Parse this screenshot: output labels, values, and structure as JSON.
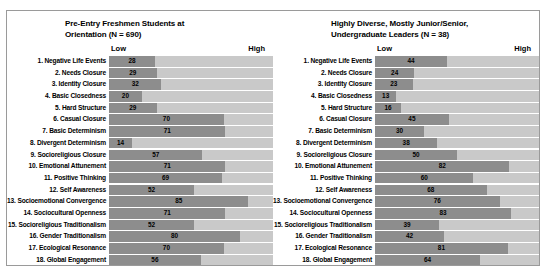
{
  "figure": {
    "background": "#ffffff",
    "bar_color": "#8d8d8d",
    "track_color": "#c9c9c9",
    "border_color": "#9a9a9a"
  },
  "axis": {
    "low_label": "Low",
    "high_label": "High",
    "min": 0,
    "max": 100
  },
  "chart_data": [
    {
      "type": "bar",
      "orientation": "horizontal",
      "title": "Pre-Entry Freshmen Students at Orientation (N = 690)",
      "title_line1": "Pre-Entry Freshmen Students at",
      "title_line2": "Orientation (N = 690)",
      "xlabel": "",
      "ylabel": "",
      "xlim": [
        0,
        100
      ],
      "grid": false,
      "legend": "none",
      "tick_labels": [
        "Low",
        "High"
      ],
      "categories": [
        "1. Negative Life Events",
        "2. Needs Closure",
        "3. Identity Closure",
        "4. Basic Closedness",
        "5. Hard Structure",
        "6. Casual Closure",
        "7. Basic Determinism",
        "8. Divergent Determinism",
        "9. Socioreligious Closure",
        "10. Emotional Attunement",
        "11. Positive Thinking",
        "12. Self Awareness",
        "13. Socioemotional Convergence",
        "14. Sociocultural Openness",
        "15. Socioreligious Traditionalism",
        "16. Gender Traditionalism",
        "17. Ecological Resonance",
        "18. Global Engagement"
      ],
      "values": [
        28,
        29,
        32,
        20,
        29,
        70,
        71,
        14,
        57,
        71,
        69,
        52,
        85,
        71,
        52,
        80,
        70,
        56
      ]
    },
    {
      "type": "bar",
      "orientation": "horizontal",
      "title": "Highly Diverse, Mostly Junior/Senior, Undergraduate Leaders (N = 38)",
      "title_line1": "Highly Diverse, Mostly Junior/Senior,",
      "title_line2": "Undergraduate Leaders (N = 38)",
      "xlabel": "",
      "ylabel": "",
      "xlim": [
        0,
        100
      ],
      "grid": false,
      "legend": "none",
      "tick_labels": [
        "Low",
        "High"
      ],
      "categories": [
        "1. Negative Life Events",
        "2. Needs Closure",
        "3. Identity Closure",
        "4. Basic Closedness",
        "5. Hard Structure",
        "6. Casual Closure",
        "7. Basic Determinism",
        "8. Divergent Determinism",
        "9. Socioreligious Closure",
        "10. Emotional Attunement",
        "11. Positive Thinking",
        "12. Self Awareness",
        "13. Socioemotional Convergence",
        "14. Sociocultural Openness",
        "15. Socioreligious Traditionalism",
        "16. Gender Traditionalism",
        "17. Ecological Resonance",
        "18. Global Engagement"
      ],
      "values": [
        44,
        24,
        23,
        13,
        16,
        45,
        30,
        38,
        50,
        82,
        60,
        68,
        76,
        83,
        39,
        42,
        81,
        64
      ]
    }
  ]
}
